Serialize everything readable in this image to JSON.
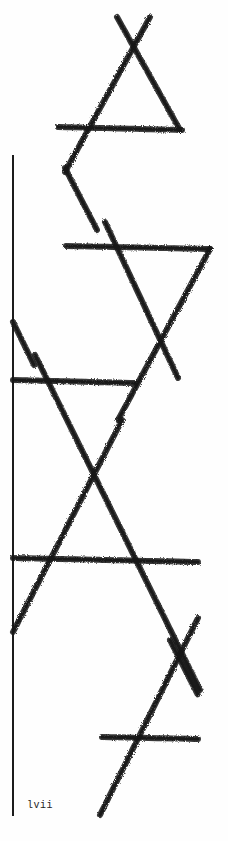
{
  "page": {
    "folio": "lvii",
    "ink_color": "#151515",
    "paper_color": "#fefefe"
  },
  "figure": {
    "strokes": [
      {
        "x1": 117,
        "y1": 17,
        "x2": 180,
        "y2": 130
      },
      {
        "x1": 150,
        "y1": 17,
        "x2": 65,
        "y2": 172
      },
      {
        "x1": 58,
        "y1": 127,
        "x2": 182,
        "y2": 130
      },
      {
        "x1": 65,
        "y1": 168,
        "x2": 97,
        "y2": 230
      },
      {
        "x1": 66,
        "y1": 246,
        "x2": 210,
        "y2": 249
      },
      {
        "x1": 105,
        "y1": 222,
        "x2": 178,
        "y2": 378
      },
      {
        "x1": 210,
        "y1": 249,
        "x2": 118,
        "y2": 420
      },
      {
        "x1": 13,
        "y1": 380,
        "x2": 135,
        "y2": 383
      },
      {
        "x1": 13,
        "y1": 322,
        "x2": 34,
        "y2": 365
      },
      {
        "x1": 35,
        "y1": 355,
        "x2": 200,
        "y2": 690
      },
      {
        "x1": 122,
        "y1": 420,
        "x2": 13,
        "y2": 632
      },
      {
        "x1": 13,
        "y1": 558,
        "x2": 198,
        "y2": 562
      },
      {
        "x1": 198,
        "y1": 618,
        "x2": 100,
        "y2": 815
      },
      {
        "x1": 170,
        "y1": 640,
        "x2": 198,
        "y2": 695
      },
      {
        "x1": 102,
        "y1": 737,
        "x2": 198,
        "y2": 739
      }
    ]
  }
}
